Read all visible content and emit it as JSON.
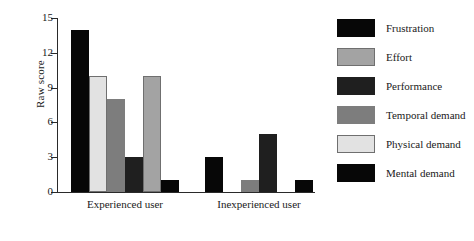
{
  "chart_data": {
    "type": "bar",
    "title": "",
    "xlabel": "",
    "ylabel": "Raw score",
    "ylim": [
      0,
      15
    ],
    "yticks": [
      0,
      3,
      6,
      9,
      12,
      15
    ],
    "ytick_labels": [
      "0",
      "3",
      "6",
      "9",
      "12",
      "15"
    ],
    "grid": false,
    "legend_position": "right",
    "categories": [
      "Experienced user",
      "Inexperienced user"
    ],
    "series": [
      {
        "name": "Mental demand",
        "values": [
          14,
          3
        ],
        "color": "#070707"
      },
      {
        "name": "Physical demand",
        "values": [
          10,
          0
        ],
        "color": "#e2e2e2"
      },
      {
        "name": "Temporal demand",
        "values": [
          8,
          1
        ],
        "color": "#7d7d7d"
      },
      {
        "name": "Performance",
        "values": [
          3,
          5
        ],
        "color": "#1f1f1f"
      },
      {
        "name": "Effort",
        "values": [
          10,
          0
        ],
        "color": "#a3a3a3"
      },
      {
        "name": "Frustration",
        "values": [
          1,
          1
        ],
        "color": "#070707"
      }
    ]
  },
  "legend": {
    "entries": [
      {
        "label": "Frustration",
        "color": "#070707"
      },
      {
        "label": "Effort",
        "color": "#a3a3a3"
      },
      {
        "label": "Performance",
        "color": "#1f1f1f"
      },
      {
        "label": "Temporal demand",
        "color": "#7d7d7d"
      },
      {
        "label": "Physical demand",
        "color": "#e2e2e2"
      },
      {
        "label": "Mental demand",
        "color": "#070707"
      }
    ]
  }
}
